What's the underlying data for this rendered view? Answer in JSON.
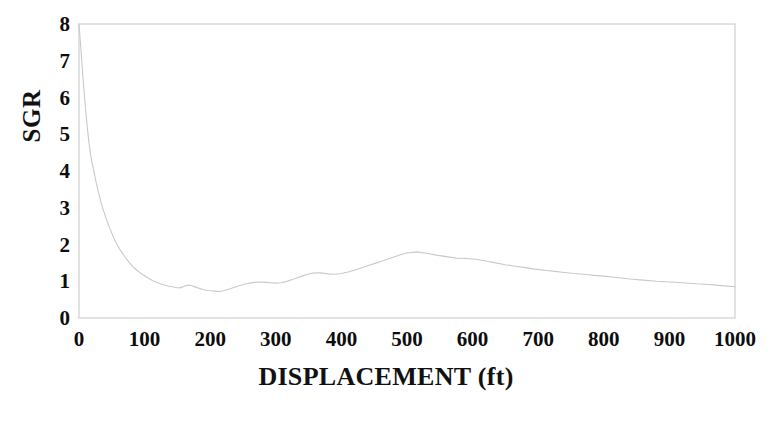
{
  "chart_data": {
    "type": "line",
    "title": "",
    "xlabel": "DISPLACEMENT (ft)",
    "ylabel": "SGR",
    "xlim": [
      0,
      1000
    ],
    "ylim": [
      0,
      8
    ],
    "grid": false,
    "legend": null,
    "x_ticks": [
      "0",
      "100",
      "200",
      "300",
      "400",
      "500",
      "600",
      "700",
      "800",
      "900",
      "1000"
    ],
    "y_ticks": [
      "0",
      "1",
      "2",
      "3",
      "4",
      "5",
      "6",
      "7",
      "8"
    ],
    "line_color": "#c9c9c9",
    "axis_color": "#cfcfcf",
    "series": [
      {
        "name": "SGR",
        "x": [
          0,
          3,
          6,
          9,
          12,
          15,
          18,
          22,
          26,
          30,
          35,
          40,
          46,
          52,
          58,
          64,
          70,
          76,
          82,
          88,
          94,
          100,
          106,
          112,
          118,
          124,
          130,
          136,
          142,
          148,
          154,
          160,
          166,
          172,
          178,
          184,
          190,
          196,
          202,
          208,
          214,
          220,
          228,
          236,
          244,
          252,
          260,
          268,
          276,
          284,
          292,
          300,
          308,
          316,
          324,
          332,
          340,
          348,
          356,
          364,
          372,
          380,
          390,
          400,
          410,
          420,
          430,
          440,
          450,
          460,
          470,
          480,
          490,
          500,
          515,
          530,
          545,
          560,
          575,
          590,
          605,
          620,
          635,
          650,
          665,
          680,
          695,
          710,
          725,
          740,
          755,
          770,
          785,
          800,
          820,
          840,
          860,
          880,
          900,
          920,
          940,
          960,
          980,
          1000
        ],
        "y": [
          8.0,
          7.3,
          6.55,
          5.9,
          5.3,
          4.8,
          4.4,
          4.05,
          3.7,
          3.4,
          3.05,
          2.78,
          2.48,
          2.22,
          2.0,
          1.82,
          1.66,
          1.52,
          1.4,
          1.3,
          1.22,
          1.15,
          1.08,
          1.02,
          0.97,
          0.93,
          0.9,
          0.87,
          0.85,
          0.83,
          0.82,
          0.86,
          0.9,
          0.88,
          0.84,
          0.8,
          0.77,
          0.75,
          0.74,
          0.73,
          0.72,
          0.74,
          0.78,
          0.83,
          0.88,
          0.92,
          0.95,
          0.97,
          0.98,
          0.97,
          0.96,
          0.95,
          0.96,
          0.99,
          1.04,
          1.09,
          1.14,
          1.19,
          1.22,
          1.23,
          1.22,
          1.2,
          1.19,
          1.21,
          1.25,
          1.3,
          1.36,
          1.42,
          1.48,
          1.54,
          1.6,
          1.66,
          1.72,
          1.77,
          1.8,
          1.76,
          1.71,
          1.67,
          1.63,
          1.62,
          1.6,
          1.55,
          1.5,
          1.45,
          1.41,
          1.37,
          1.33,
          1.3,
          1.27,
          1.24,
          1.21,
          1.19,
          1.16,
          1.14,
          1.1,
          1.06,
          1.03,
          1.0,
          0.98,
          0.96,
          0.93,
          0.91,
          0.88,
          0.85
        ]
      }
    ],
    "annotations": []
  },
  "figure": {
    "plot_box": {
      "left_px": 79,
      "top_px": 24,
      "right_px": 735,
      "bottom_px": 318
    }
  }
}
